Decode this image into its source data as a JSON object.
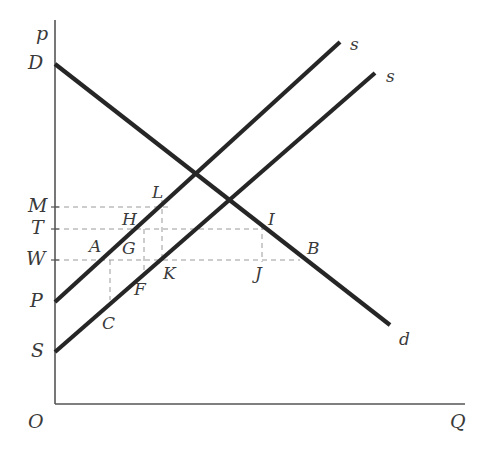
{
  "figure": {
    "background_color": "#ffffff",
    "line_color": "#262626",
    "axis_color": "#555555",
    "dashed_color": "#9a9a9a",
    "label_color": "#3a3a3a",
    "width": 489,
    "height": 461
  },
  "axes": {
    "origin": {
      "label": "O",
      "x": 55,
      "y": 404
    },
    "y_axis": {
      "label": "p",
      "x": 55,
      "top": 20,
      "bottom": 404,
      "label_x": 36,
      "label_y": 24
    },
    "x_axis": {
      "label": "Q",
      "y": 404,
      "left": 55,
      "right": 465,
      "label_x": 450,
      "label_y": 412
    },
    "origin_label_x": 28,
    "origin_label_y": 412
  },
  "y_ticks": [
    {
      "label": "D",
      "y": 64,
      "x": 28,
      "dashed": false
    },
    {
      "label": "M",
      "y": 207,
      "x": 28,
      "dashed": true,
      "dash_to_x": 170
    },
    {
      "label": "T",
      "y": 229,
      "x": 31,
      "dashed": true,
      "dash_to_x": 270
    },
    {
      "label": "W",
      "y": 260,
      "x": 26,
      "dashed": true,
      "dash_to_x": 300
    },
    {
      "label": "P",
      "y": 302,
      "x": 30,
      "dashed": false
    },
    {
      "label": "S",
      "y": 352,
      "x": 31,
      "dashed": false
    }
  ],
  "curves": [
    {
      "name": "demand",
      "label": "d",
      "x1": 55,
      "y1": 64,
      "x2": 390,
      "y2": 325,
      "label_x": 399,
      "label_y": 331
    },
    {
      "name": "supply-shifted",
      "label": "s",
      "x1": 55,
      "y1": 302,
      "x2": 340,
      "y2": 42,
      "label_x": 350,
      "label_y": 36
    },
    {
      "name": "supply-original",
      "label": "s",
      "x1": 55,
      "y1": 352,
      "x2": 375,
      "y2": 73,
      "label_x": 386,
      "label_y": 68
    }
  ],
  "horizontal_dashed_lines": [
    {
      "name": "price-level-M",
      "y": 207,
      "from_x": 55,
      "to_x": 170
    },
    {
      "name": "price-level-T",
      "y": 229,
      "from_x": 55,
      "to_x": 270
    },
    {
      "name": "price-level-W",
      "y": 260,
      "from_x": 55,
      "to_x": 300
    }
  ],
  "vertical_dashed_lines": [
    {
      "name": "quantity-C",
      "x": 110,
      "from_y": 260,
      "to_y": 300
    },
    {
      "name": "quantity-G-K",
      "x": 144,
      "from_y": 229,
      "to_y": 272
    },
    {
      "name": "quantity-H-L",
      "x": 162,
      "from_y": 200,
      "to_y": 262
    },
    {
      "name": "quantity-I-J",
      "x": 262,
      "from_y": 225,
      "to_y": 262
    }
  ],
  "points": [
    {
      "label": "L",
      "x": 152,
      "y": 184
    },
    {
      "label": "H",
      "x": 122,
      "y": 211
    },
    {
      "label": "I",
      "x": 268,
      "y": 211
    },
    {
      "label": "A",
      "x": 89,
      "y": 238
    },
    {
      "label": "G",
      "x": 122,
      "y": 240
    },
    {
      "label": "B",
      "x": 307,
      "y": 240
    },
    {
      "label": "K",
      "x": 163,
      "y": 265
    },
    {
      "label": "J",
      "x": 255,
      "y": 265
    },
    {
      "label": "F",
      "x": 134,
      "y": 281
    },
    {
      "label": "C",
      "x": 102,
      "y": 315
    }
  ]
}
